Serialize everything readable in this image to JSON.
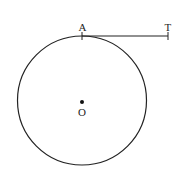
{
  "diagram": {
    "labels": {
      "point_a": "A",
      "point_t": "T",
      "center_o": "O"
    },
    "colors": {
      "stroke": "#222222",
      "background": "#ffffff"
    }
  }
}
